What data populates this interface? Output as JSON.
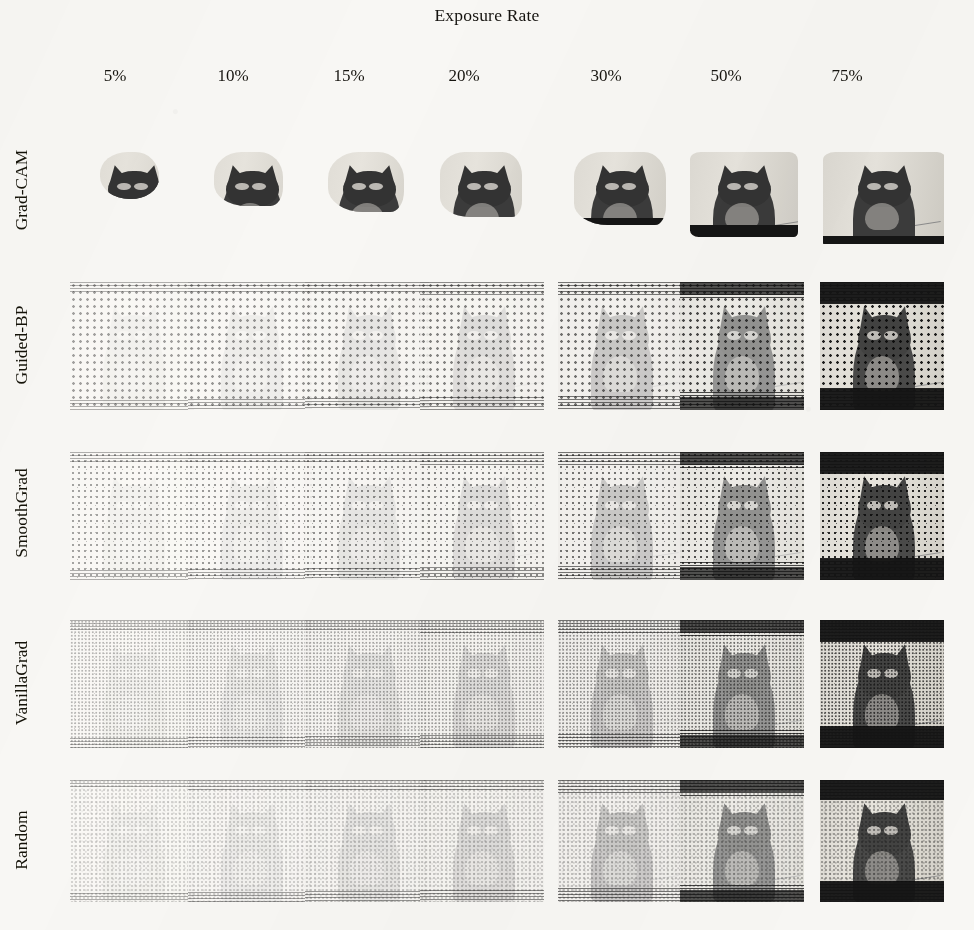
{
  "figure": {
    "title": "Exposure Rate"
  },
  "columns": [
    {
      "label": "5%",
      "value": 5,
      "center_x": 115
    },
    {
      "label": "10%",
      "value": 10,
      "center_x": 233
    },
    {
      "label": "15%",
      "value": 15,
      "center_x": 349
    },
    {
      "label": "20%",
      "value": 20,
      "center_x": 464
    },
    {
      "label": "30%",
      "value": 30,
      "center_x": 606
    },
    {
      "label": "50%",
      "value": 50,
      "center_x": 726
    },
    {
      "label": "75%",
      "value": 75,
      "center_x": 847
    }
  ],
  "rows": [
    {
      "label": "Grad-CAM",
      "label_center_y": 190,
      "cell_top": 146,
      "cell_height": 98,
      "style": "blob"
    },
    {
      "label": "Guided-BP",
      "label_center_y": 345,
      "cell_top": 282,
      "cell_height": 128,
      "style": "guided"
    },
    {
      "label": "SmoothGrad",
      "label_center_y": 513,
      "cell_top": 452,
      "cell_height": 128,
      "style": "smooth"
    },
    {
      "label": "VanillaGrad",
      "label_center_y": 683,
      "cell_top": 620,
      "cell_height": 128,
      "style": "vanilla"
    },
    {
      "label": "Random",
      "label_center_y": 840,
      "cell_top": 780,
      "cell_height": 122,
      "style": "random"
    }
  ],
  "grid": {
    "cell_width": 124,
    "column_lefts": [
      70,
      188,
      305,
      420,
      558,
      680,
      820
    ],
    "rate_fractions": [
      0.05,
      0.1,
      0.15,
      0.2,
      0.3,
      0.5,
      0.75
    ]
  },
  "colors": {
    "page_background": "#f8f7f4",
    "ink": "#171717",
    "band_dark": "#151515",
    "photo_mid": "#3b3b3b",
    "photo_light": "#e2dfd8"
  }
}
